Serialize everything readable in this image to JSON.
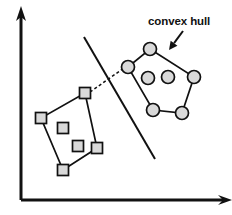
{
  "figure": {
    "width": 232,
    "height": 215,
    "background_color": "#ffffff",
    "stroke_color": "#111111",
    "marker_fill_color": "#d9d9d9"
  },
  "annotation": {
    "label": "convex hull",
    "label_x": 148,
    "label_y": 16,
    "arrow_from": [
      183,
      31
    ],
    "arrow_to": [
      169,
      50
    ]
  },
  "axes": {
    "origin": [
      21,
      200
    ],
    "y_axis_top": [
      21,
      14
    ],
    "x_axis_right": [
      226,
      200
    ],
    "y_label": "",
    "x_label": ""
  },
  "separating_line": {
    "name": "separating-line",
    "from": [
      84,
      37
    ],
    "to": [
      155,
      159
    ],
    "style": "solid"
  },
  "connector": {
    "name": "nearest-pair-connector",
    "from": [
      90,
      92
    ],
    "to": [
      124,
      68
    ],
    "style": "dashed"
  },
  "clusters": [
    {
      "name": "square-cluster",
      "marker": "square",
      "marker_size": 11,
      "hull_points": [
        [
          85,
          93
        ],
        [
          97,
          148
        ],
        [
          63,
          170
        ],
        [
          41,
          118
        ]
      ],
      "interior_points": [
        [
          63,
          128
        ],
        [
          78,
          146
        ]
      ]
    },
    {
      "name": "circle-cluster",
      "marker": "circle",
      "marker_radius": 6.5,
      "hull_points": [
        [
          150,
          49
        ],
        [
          194,
          77
        ],
        [
          182,
          113
        ],
        [
          153,
          110
        ],
        [
          128,
          67
        ]
      ],
      "interior_points": [
        [
          148,
          78
        ],
        [
          168,
          77
        ]
      ]
    }
  ]
}
